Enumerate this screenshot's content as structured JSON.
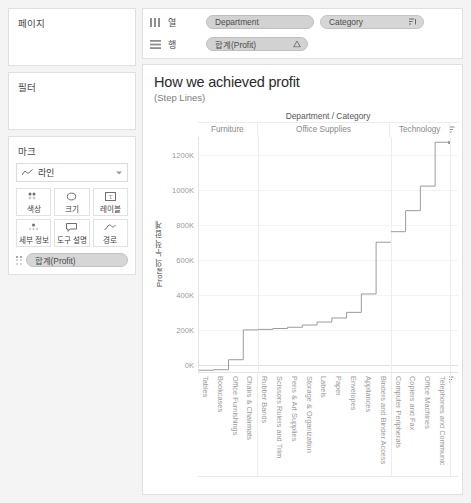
{
  "sidebar": {
    "pages": {
      "title": "페이지"
    },
    "filters": {
      "title": "필터"
    },
    "marks": {
      "title": "마크",
      "type_label": "라인",
      "type_icon": "line-mark-icon",
      "buttons": [
        {
          "label": "색상",
          "icon": "color-icon"
        },
        {
          "label": "크기",
          "icon": "size-icon"
        },
        {
          "label": "레이블",
          "icon": "label-icon"
        },
        {
          "label": "세부 정보",
          "icon": "detail-icon"
        },
        {
          "label": "도구 설명",
          "icon": "tooltip-icon"
        },
        {
          "label": "경로",
          "icon": "path-icon"
        }
      ],
      "pill": {
        "label": "합계(Profit)",
        "icon": "detail-dots-icon"
      }
    }
  },
  "shelves": {
    "columns": {
      "name": "열",
      "icon": "columns-icon",
      "pills": [
        {
          "label": "Department",
          "end_icon": ""
        },
        {
          "label": "Category",
          "end_icon": "sort-descending-icon"
        }
      ]
    },
    "rows": {
      "name": "행",
      "icon": "rows-icon",
      "pills": [
        {
          "label": "합계(Profit)",
          "end_icon": "table-calc-delta-icon"
        }
      ]
    }
  },
  "viz": {
    "title": "How we achieved profit",
    "subtitle": "(Step Lines)",
    "column_header_title": "Department / Category",
    "corner_icon": "sort-icon"
  },
  "chart_data": {
    "type": "line",
    "title": "How we achieved profit",
    "subtitle": "(Step Lines)",
    "xlabel": "Department / Category",
    "ylabel": "Profit의 누적 합계",
    "ylim": [
      -40000,
      1300000
    ],
    "yticks": [
      0,
      200000,
      400000,
      600000,
      800000,
      1000000,
      1200000
    ],
    "ytick_labels": [
      "0K",
      "200K",
      "400K",
      "600K",
      "800K",
      "1000K",
      "1200K"
    ],
    "grid": true,
    "legend": "none",
    "panels": [
      {
        "name": "Furniture",
        "categories": [
          "Tables",
          "Bookcases",
          "Office Furnishings",
          "Chairs & Chairmats"
        ],
        "values": [
          -30000,
          -27000,
          30000,
          200000
        ]
      },
      {
        "name": "Office Supplies",
        "categories": [
          "Rubber Bands",
          "Scissors Rulers and Trim",
          "Pens & Art Supplies",
          "Storage & Organization",
          "Labels",
          "Paper",
          "Envelopes",
          "Appliances",
          "Binders and Binder Access"
        ],
        "values": [
          203000,
          208000,
          215000,
          228000,
          245000,
          268000,
          300000,
          405000,
          700000
        ]
      },
      {
        "name": "Technology",
        "categories": [
          "Computer Peripherals",
          "Copiers and Fax",
          "Office Machines",
          "Telephones and Communic"
        ],
        "values": [
          760000,
          880000,
          1020000,
          1270000
        ]
      }
    ]
  }
}
